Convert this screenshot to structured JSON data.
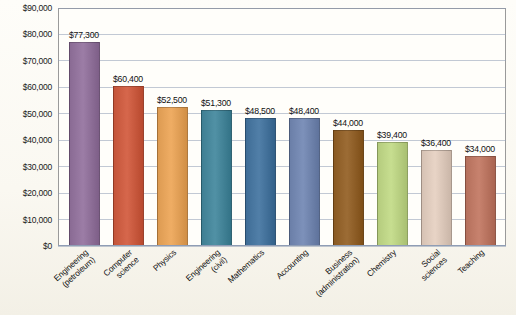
{
  "chart_data": {
    "type": "bar",
    "title": "",
    "xlabel": "",
    "ylabel": "",
    "ylim": [
      0,
      90000
    ],
    "grid": true,
    "legend": "none",
    "categories": [
      "Engineering (petroleum)",
      "Computer science",
      "Physics",
      "Engineering (civil)",
      "Mathematics",
      "Accounting",
      "Business (administration)",
      "Chemistry",
      "Social sciences",
      "Teaching"
    ],
    "category_lines": [
      [
        "Engineering",
        "(petroleum)"
      ],
      [
        "Computer",
        "science"
      ],
      [
        "Physics"
      ],
      [
        "Engineering",
        "(civil)"
      ],
      [
        "Mathematics"
      ],
      [
        "Accounting"
      ],
      [
        "Business",
        "(administration)"
      ],
      [
        "Chemistry"
      ],
      [
        "Social",
        "sciences"
      ],
      [
        "Teaching"
      ]
    ],
    "values": [
      77300,
      60400,
      52500,
      51300,
      48500,
      48400,
      44000,
      39400,
      36400,
      34000
    ],
    "data_labels": [
      "$77,300",
      "$60,400",
      "$52,500",
      "$51,300",
      "$48,500",
      "$48,400",
      "$44,000",
      "$39,400",
      "$36,400",
      "$34,000"
    ],
    "bar_colors": [
      "#8a6b94",
      "#c4553a",
      "#dd9b52",
      "#3f7f93",
      "#3f6d96",
      "#6b7fa8",
      "#8a5a23",
      "#b5cc7e",
      "#d6c2b4",
      "#b5705c"
    ],
    "ytick_labels": [
      "$90,000",
      "$80,000",
      "$70,000",
      "$60,000",
      "$50,000",
      "$40,000",
      "$30,000",
      "$20,000",
      "$10,000",
      "$0"
    ],
    "ytick_values": [
      90000,
      80000,
      70000,
      60000,
      50000,
      40000,
      30000,
      20000,
      10000,
      0
    ]
  }
}
